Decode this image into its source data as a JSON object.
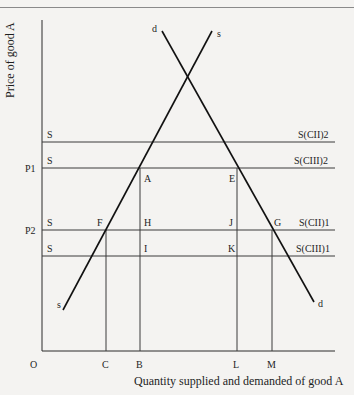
{
  "diagram": {
    "y_axis_label": "Price of good A",
    "x_axis_label": "Quantity supplied and demanded of good A",
    "origin_label": "O",
    "curves": {
      "demand": {
        "label_top": "d",
        "label_bottom": "d"
      },
      "supply": {
        "label_top": "s",
        "label_bottom": "s"
      }
    },
    "price_levels": [
      {
        "left_label": "S",
        "axis_label": "",
        "right_label": "S(CII)2"
      },
      {
        "left_label": "S",
        "axis_label": "P1",
        "right_label": "S(CIII)2"
      },
      {
        "left_label": "S",
        "axis_label": "P2",
        "right_label": "S(CII)1"
      },
      {
        "left_label": "S",
        "axis_label": "",
        "right_label": "S(CIII)1"
      }
    ],
    "points": {
      "A": "A",
      "E": "E",
      "F": "F",
      "H": "H",
      "I": "I",
      "J": "J",
      "K": "K",
      "G": "G"
    },
    "quantity_ticks": [
      "C",
      "B",
      "L",
      "M"
    ],
    "colors": {
      "line": "#1e1e1e",
      "background": "#f4f3f1"
    }
  }
}
